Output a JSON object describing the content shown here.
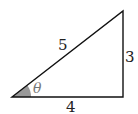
{
  "diagram": {
    "type": "right-triangle",
    "hypotenuse_label": "5",
    "opposite_label": "3",
    "adjacent_label": "4",
    "angle_label": "θ",
    "colors": {
      "stroke": "#111111",
      "angle_fill": "#999999",
      "angle_label": "#777777"
    }
  }
}
